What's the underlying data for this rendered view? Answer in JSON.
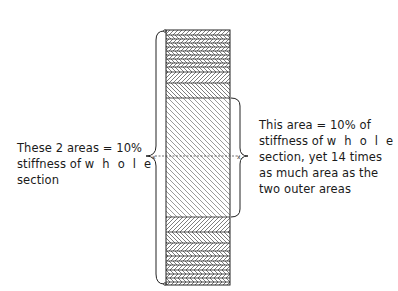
{
  "diagram": {
    "title": "",
    "left_label": {
      "lines": [
        "These 2 areas = 10%",
        "stiffness of ",
        "w h o l e",
        "section"
      ],
      "text": "These 2 areas = 10% stiffness of whole section"
    },
    "right_label": {
      "lines": [
        "This area = 10% of",
        "stiffness of ",
        "w h o l e",
        "section, yet 14 times",
        "as much area as the",
        "two outer areas"
      ],
      "text": "This area = 10% of stiffness of whole section, yet 14 times as much area as the two outer areas"
    },
    "neutral_axis_marker": "x",
    "column": {
      "x": 166,
      "y": 30,
      "width": 64,
      "height": 255,
      "top_layers": [
        30,
        35,
        39,
        43,
        47,
        51,
        55,
        59,
        63,
        67,
        72,
        83,
        98
      ],
      "core": {
        "y_start": 98,
        "y_end": 217,
        "stiffness_pct": 10,
        "area_ratio": 14
      },
      "bottom_layers": [
        217,
        232,
        243,
        251,
        256,
        261,
        265,
        270,
        274,
        278,
        282,
        285
      ]
    },
    "colors": {
      "ink": "#1a1a1a",
      "hatch": "#555555",
      "background": "#ffffff"
    }
  }
}
